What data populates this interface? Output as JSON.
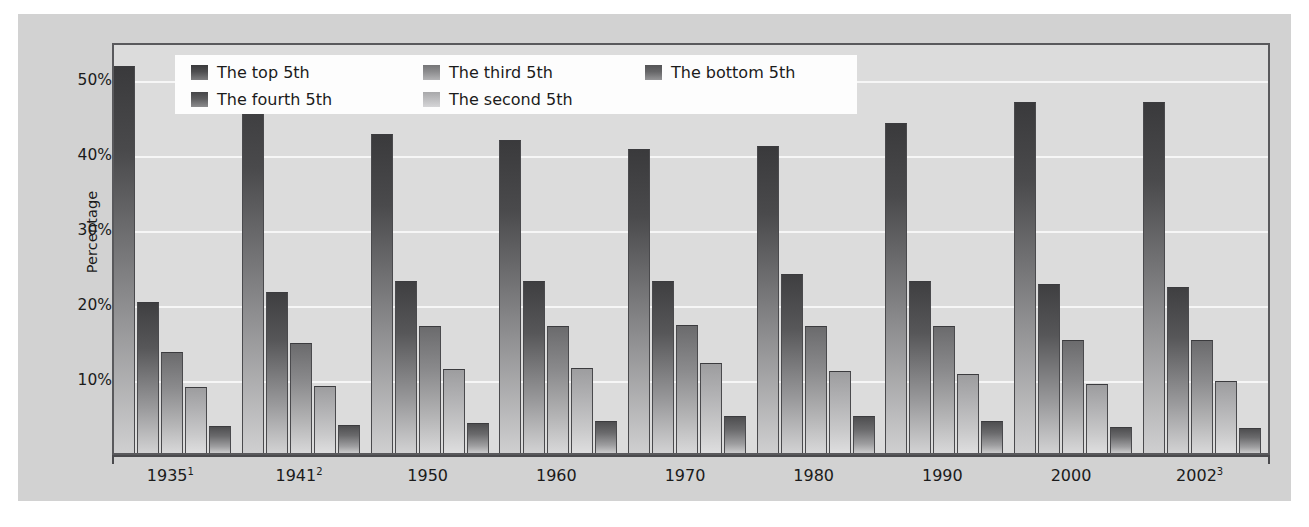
{
  "chart_data": {
    "type": "bar",
    "title": "",
    "xlabel": "",
    "ylabel": "Percentage",
    "ylim": [
      0,
      55
    ],
    "grid": true,
    "legend_position": "top-inside",
    "y_ticks": [
      {
        "value": 10,
        "label": "10%"
      },
      {
        "value": 20,
        "label": "20%"
      },
      {
        "value": 30,
        "label": "30%"
      },
      {
        "value": 40,
        "label": "40%"
      },
      {
        "value": 50,
        "label": "50%"
      }
    ],
    "categories": [
      "1935",
      "1941",
      "1950",
      "1960",
      "1970",
      "1980",
      "1990",
      "2000",
      "2002"
    ],
    "category_labels": [
      {
        "text": "1935",
        "footnote": "1"
      },
      {
        "text": "1941",
        "footnote": "2"
      },
      {
        "text": "1950",
        "footnote": ""
      },
      {
        "text": "1960",
        "footnote": ""
      },
      {
        "text": "1970",
        "footnote": ""
      },
      {
        "text": "1980",
        "footnote": ""
      },
      {
        "text": "1990",
        "footnote": ""
      },
      {
        "text": "2000",
        "footnote": ""
      },
      {
        "text": "2002",
        "footnote": "3"
      }
    ],
    "series": [
      {
        "name": "The top 5th",
        "values": [
          51.7,
          48.8,
          42.6,
          41.8,
          40.6,
          41.0,
          44.0,
          46.8,
          46.9
        ]
      },
      {
        "name": "The fourth 5th",
        "values": [
          20.2,
          21.5,
          22.9,
          23.0,
          22.9,
          23.9,
          23.0,
          22.5,
          22.2
        ]
      },
      {
        "name": "The third 5th",
        "values": [
          13.5,
          14.7,
          17.0,
          17.0,
          17.1,
          17.0,
          17.0,
          15.1,
          15.1
        ]
      },
      {
        "name": "The second 5th",
        "values": [
          8.8,
          9.0,
          11.2,
          11.3,
          12.0,
          11.0,
          10.5,
          9.2,
          9.6
        ]
      },
      {
        "name": "The bottom 5th",
        "values": [
          3.6,
          3.7,
          4.0,
          4.3,
          4.9,
          4.9,
          4.3,
          3.5,
          3.4
        ]
      }
    ]
  },
  "legend": {
    "entries": [
      {
        "label": "The top 5th",
        "swatch": "swatch-top-5th"
      },
      {
        "label": "The fourth 5th",
        "swatch": "swatch-fourth-5th"
      },
      {
        "label": "The third 5th",
        "swatch": "swatch-third-5th"
      },
      {
        "label": "The second 5th",
        "swatch": "swatch-second-5th"
      },
      {
        "label": "The bottom 5th",
        "swatch": "swatch-bottom-5th"
      }
    ]
  },
  "colors": {
    "figure_background": "#d2d2d2",
    "plot_background": "#dcdcdc",
    "gridline": "#f6f6f6",
    "axis": "#59595c",
    "legend_background": "#fdfdfd",
    "text": "#1b1b1b"
  }
}
